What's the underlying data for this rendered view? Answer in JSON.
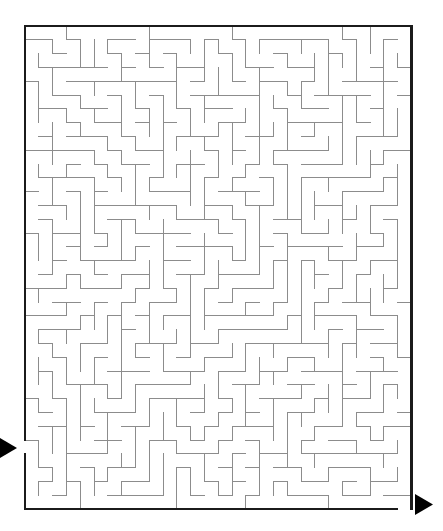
{
  "document": {
    "title": "Maze Puzzle",
    "kind": "printable-maze",
    "canvas": {
      "width": 443,
      "height": 531,
      "background": "#ffffff"
    }
  },
  "maze": {
    "type": "perfect-maze",
    "columns": 28,
    "rows": 35,
    "cell_size": 13.8,
    "origin_x": 25,
    "origin_y": 26,
    "width": 386,
    "height": 483,
    "seed": 20240517,
    "wall_color": "#8c8c8c",
    "wall_thickness": 1,
    "border_color": "#1b1b1b",
    "border_thickness": 2.2,
    "background_color": "#ffffff"
  },
  "entrance": {
    "label": "entrance",
    "side": "left",
    "cell_row": 30,
    "cell_column": 0,
    "gap_y": 440,
    "gap_height": 14,
    "arrow": {
      "direction": "right",
      "color": "#000000",
      "x": 0,
      "y": 438,
      "width": 17,
      "height": 20
    }
  },
  "exit": {
    "label": "exit",
    "side": "bottom-right",
    "cell_row": 34,
    "cell_column": 27,
    "gap_x": 397,
    "gap_width": 14,
    "arrow": {
      "direction": "right",
      "color": "#000000",
      "x": 415,
      "y": 494,
      "width": 18,
      "height": 21
    }
  }
}
